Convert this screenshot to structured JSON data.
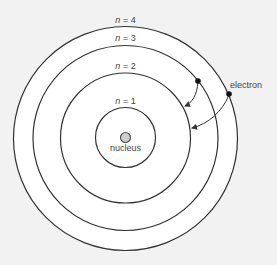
{
  "diagram": {
    "type": "Bohr atomic model",
    "colors": {
      "background": "#f2f2f2",
      "orbit_fill": "#ffffff",
      "orbit_stroke": "#333333",
      "nucleus_fill": "#cfcfcf",
      "electron_fill": "#111111",
      "text": "#444444"
    },
    "orbits": [
      {
        "n_symbol": "n",
        "eq": " = 1",
        "level": 1
      },
      {
        "n_symbol": "n",
        "eq": " = 2",
        "level": 2
      },
      {
        "n_symbol": "n",
        "eq": " = 3",
        "level": 3
      },
      {
        "n_symbol": "n",
        "eq": " = 4",
        "level": 4
      }
    ],
    "nucleus_label": "nucleus",
    "electron_label": "electron",
    "transitions": [
      {
        "from_level": 3,
        "to_level": 2
      },
      {
        "from_level": 4,
        "to_level": 2
      }
    ]
  }
}
